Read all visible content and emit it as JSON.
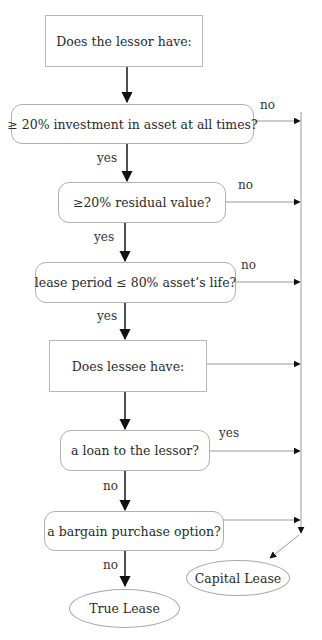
{
  "diagram": {
    "nodes": [
      {
        "id": "lessor_q",
        "shape": "rectangle",
        "label": "Does the lessor have:"
      },
      {
        "id": "investment",
        "shape": "rounded",
        "label": "≥ 20% investment in asset at all times?"
      },
      {
        "id": "residual",
        "shape": "rounded",
        "label": "≥20% residual value?"
      },
      {
        "id": "period",
        "shape": "rounded",
        "label": "lease period ≤ 80% asset’s life?"
      },
      {
        "id": "lessee_q",
        "shape": "rectangle",
        "label": "Does lessee have:"
      },
      {
        "id": "loan",
        "shape": "rounded",
        "label": "a loan to the lessor?"
      },
      {
        "id": "bargain",
        "shape": "rounded",
        "label": "a bargain purchase option?"
      },
      {
        "id": "true_lease",
        "shape": "ellipse",
        "label": "True Lease"
      },
      {
        "id": "capital_lease",
        "shape": "ellipse",
        "label": "Capital Lease"
      }
    ],
    "edge_labels": {
      "investment_yes": "yes",
      "investment_no": "no",
      "residual_yes": "yes",
      "residual_no": "no",
      "period_yes": "yes",
      "period_no": "no",
      "loan_yes": "yes",
      "loan_no": "no",
      "bargain_no": "no"
    },
    "edges": [
      {
        "from": "lessor_q",
        "to": "investment",
        "label": ""
      },
      {
        "from": "investment",
        "to": "residual",
        "label": "yes"
      },
      {
        "from": "investment",
        "to": "capital_lease",
        "label": "no"
      },
      {
        "from": "residual",
        "to": "period",
        "label": "yes"
      },
      {
        "from": "residual",
        "to": "capital_lease",
        "label": "no"
      },
      {
        "from": "period",
        "to": "lessee_q",
        "label": "yes"
      },
      {
        "from": "period",
        "to": "capital_lease",
        "label": "no"
      },
      {
        "from": "lessee_q",
        "to": "loan",
        "label": ""
      },
      {
        "from": "lessee_q",
        "to": "capital_lease",
        "label": ""
      },
      {
        "from": "loan",
        "to": "bargain",
        "label": "no"
      },
      {
        "from": "loan",
        "to": "capital_lease",
        "label": "yes"
      },
      {
        "from": "bargain",
        "to": "true_lease",
        "label": "no"
      },
      {
        "from": "bargain",
        "to": "capital_lease",
        "label": ""
      }
    ]
  }
}
